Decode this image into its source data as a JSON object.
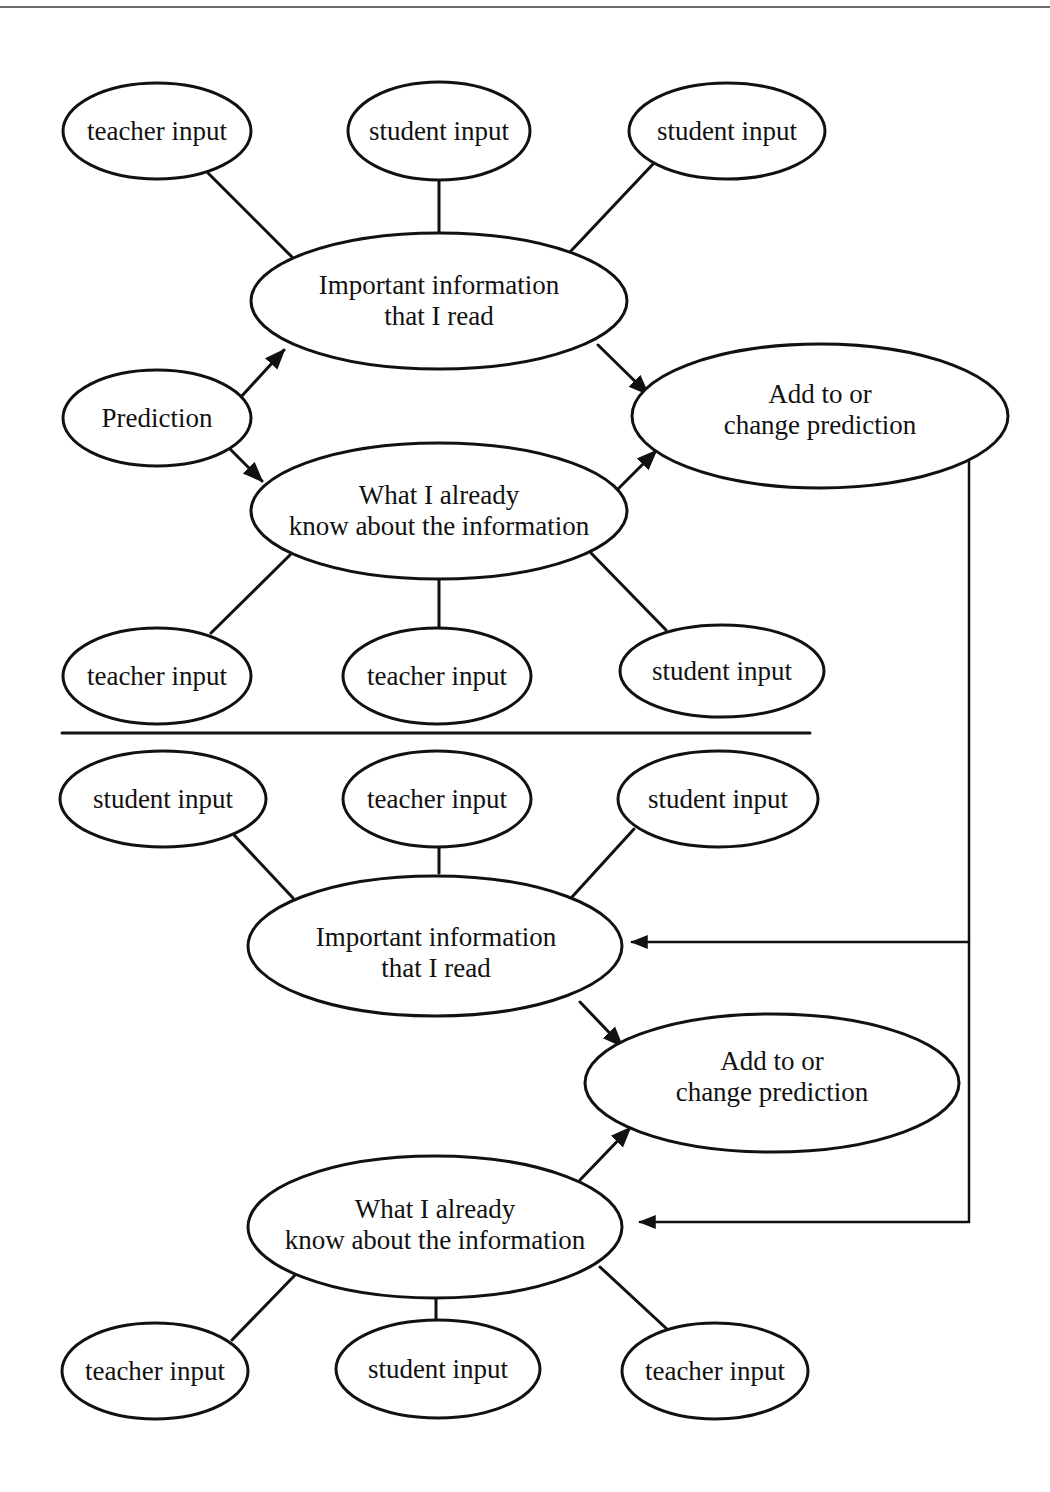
{
  "colors": {
    "stroke": "#111111",
    "background": "#ffffff",
    "top_rule": "#6a6a6a"
  },
  "upper_diagram": {
    "input_nodes_top": [
      {
        "id": "u_in_1",
        "label": "teacher input"
      },
      {
        "id": "u_in_2",
        "label": "student input"
      },
      {
        "id": "u_in_3",
        "label": "student input"
      }
    ],
    "important_information": {
      "label": "Important information\nthat I read"
    },
    "prediction": {
      "label": "Prediction"
    },
    "add_change_prediction": {
      "label": "Add to or\nchange prediction"
    },
    "already_know": {
      "label": "What I already\nknow about the information"
    },
    "input_nodes_bottom": [
      {
        "id": "u_in_4",
        "label": "teacher input"
      },
      {
        "id": "u_in_5",
        "label": "teacher input"
      },
      {
        "id": "u_in_6",
        "label": "student input"
      }
    ]
  },
  "lower_diagram": {
    "input_nodes_top": [
      {
        "id": "l_in_1",
        "label": "student input"
      },
      {
        "id": "l_in_2",
        "label": "teacher input"
      },
      {
        "id": "l_in_3",
        "label": "student input"
      }
    ],
    "important_information": {
      "label": "Important information\nthat I read"
    },
    "add_change_prediction": {
      "label": "Add to or\nchange prediction"
    },
    "already_know": {
      "label": "What I already\nknow about the information"
    },
    "input_nodes_bottom": [
      {
        "id": "l_in_4",
        "label": "teacher input"
      },
      {
        "id": "l_in_5",
        "label": "student input"
      },
      {
        "id": "l_in_6",
        "label": "teacher input"
      }
    ]
  },
  "edges": [
    {
      "from": "u_in_1",
      "to": "important_information_upper",
      "type": "line"
    },
    {
      "from": "u_in_2",
      "to": "important_information_upper",
      "type": "line"
    },
    {
      "from": "u_in_3",
      "to": "important_information_upper",
      "type": "line"
    },
    {
      "from": "prediction",
      "to": "important_information_upper",
      "type": "arrow"
    },
    {
      "from": "prediction",
      "to": "already_know_upper",
      "type": "arrow"
    },
    {
      "from": "important_information_upper",
      "to": "add_change_prediction_upper",
      "type": "arrow"
    },
    {
      "from": "already_know_upper",
      "to": "add_change_prediction_upper",
      "type": "arrow"
    },
    {
      "from": "u_in_4",
      "to": "already_know_upper",
      "type": "line"
    },
    {
      "from": "u_in_5",
      "to": "already_know_upper",
      "type": "line"
    },
    {
      "from": "u_in_6",
      "to": "already_know_upper",
      "type": "line"
    },
    {
      "from": "add_change_prediction_upper",
      "to": "important_information_lower",
      "type": "arrow",
      "route": "feedback"
    },
    {
      "from": "add_change_prediction_upper",
      "to": "already_know_lower",
      "type": "arrow",
      "route": "feedback"
    },
    {
      "from": "l_in_1",
      "to": "important_information_lower",
      "type": "line"
    },
    {
      "from": "l_in_2",
      "to": "important_information_lower",
      "type": "line"
    },
    {
      "from": "l_in_3",
      "to": "important_information_lower",
      "type": "line"
    },
    {
      "from": "important_information_lower",
      "to": "add_change_prediction_lower",
      "type": "arrow"
    },
    {
      "from": "already_know_lower",
      "to": "add_change_prediction_lower",
      "type": "arrow"
    },
    {
      "from": "l_in_4",
      "to": "already_know_lower",
      "type": "line"
    },
    {
      "from": "l_in_5",
      "to": "already_know_lower",
      "type": "line"
    },
    {
      "from": "l_in_6",
      "to": "already_know_lower",
      "type": "line"
    }
  ]
}
